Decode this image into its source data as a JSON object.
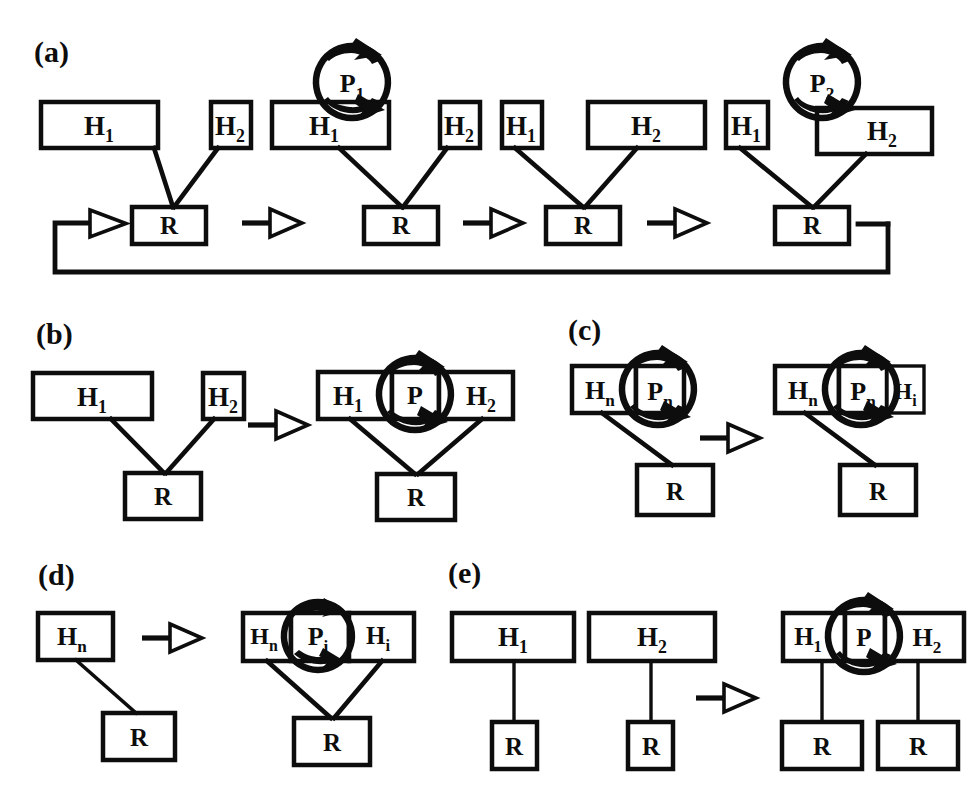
{
  "figure": {
    "title": "",
    "background": "#ffffff",
    "ink_color": "#0d0d0d",
    "width": 971,
    "height": 787
  },
  "panels": [
    {
      "id": "a",
      "label": "(a)"
    },
    {
      "id": "b",
      "label": "(b)"
    },
    {
      "id": "c",
      "label": "(c)"
    },
    {
      "id": "d",
      "label": "(d)"
    },
    {
      "id": "e",
      "label": "(e)"
    }
  ],
  "node_labels": {
    "h": "H",
    "r": "R",
    "p": "P",
    "sub_1": "1",
    "sub_2": "2",
    "sub_n": "n",
    "sub_i": "i"
  },
  "panel_a": {
    "label": "(a)",
    "stages": [
      {
        "index": 1,
        "boxes": [
          {
            "name": "H",
            "sub": "1",
            "width": "wide"
          },
          {
            "name": "H",
            "sub": "2",
            "width": "narrow"
          },
          {
            "name": "R",
            "sub": "",
            "width": "medium"
          }
        ],
        "promoter": null
      },
      {
        "index": 2,
        "boxes": [
          {
            "name": "H",
            "sub": "1",
            "width": "wide"
          },
          {
            "name": "H",
            "sub": "2",
            "width": "narrow"
          },
          {
            "name": "R",
            "sub": "",
            "width": "medium"
          }
        ],
        "promoter": {
          "name": "P",
          "sub": "1",
          "over": "H1"
        }
      },
      {
        "index": 3,
        "boxes": [
          {
            "name": "H",
            "sub": "1",
            "width": "narrow"
          },
          {
            "name": "H",
            "sub": "2",
            "width": "wide"
          },
          {
            "name": "R",
            "sub": "",
            "width": "medium"
          }
        ],
        "promoter": null
      },
      {
        "index": 4,
        "boxes": [
          {
            "name": "H",
            "sub": "1",
            "width": "narrow"
          },
          {
            "name": "H",
            "sub": "2",
            "width": "wide"
          },
          {
            "name": "R",
            "sub": "",
            "width": "medium"
          }
        ],
        "promoter": {
          "name": "P",
          "sub": "2",
          "over": "H2"
        }
      }
    ],
    "transitions": 3,
    "feedback_loop": true
  },
  "panel_b": {
    "label": "(b)",
    "left": {
      "boxes": [
        {
          "name": "H",
          "sub": "1"
        },
        {
          "name": "H",
          "sub": "2"
        },
        {
          "name": "R",
          "sub": ""
        }
      ]
    },
    "right": {
      "boxes": [
        {
          "name": "H",
          "sub": "1"
        },
        {
          "name": "P",
          "sub": ""
        },
        {
          "name": "H",
          "sub": "2"
        },
        {
          "name": "R",
          "sub": ""
        }
      ],
      "promoter": {
        "name": "P",
        "sub": ""
      }
    }
  },
  "panel_c": {
    "label": "(c)",
    "left": {
      "boxes": [
        {
          "name": "H",
          "sub": "n"
        },
        {
          "name": "P",
          "sub": "n"
        },
        {
          "name": "R",
          "sub": ""
        }
      ]
    },
    "right": {
      "boxes": [
        {
          "name": "H",
          "sub": "n"
        },
        {
          "name": "P",
          "sub": "n"
        },
        {
          "name": "H",
          "sub": "i"
        },
        {
          "name": "R",
          "sub": ""
        }
      ]
    }
  },
  "panel_d": {
    "label": "(d)",
    "left": {
      "boxes": [
        {
          "name": "H",
          "sub": "n"
        },
        {
          "name": "R",
          "sub": ""
        }
      ]
    },
    "right": {
      "boxes": [
        {
          "name": "H",
          "sub": "n"
        },
        {
          "name": "P",
          "sub": "i"
        },
        {
          "name": "H",
          "sub": "i"
        },
        {
          "name": "R",
          "sub": ""
        }
      ]
    }
  },
  "panel_e": {
    "label": "(e)",
    "left": {
      "boxes": [
        {
          "name": "H",
          "sub": "1"
        },
        {
          "name": "R",
          "sub": ""
        },
        {
          "name": "H",
          "sub": "2"
        },
        {
          "name": "R",
          "sub": ""
        }
      ]
    },
    "right": {
      "boxes": [
        {
          "name": "H",
          "sub": "1"
        },
        {
          "name": "P",
          "sub": ""
        },
        {
          "name": "H",
          "sub": "2"
        },
        {
          "name": "R",
          "sub": ""
        },
        {
          "name": "R",
          "sub": ""
        }
      ]
    }
  }
}
